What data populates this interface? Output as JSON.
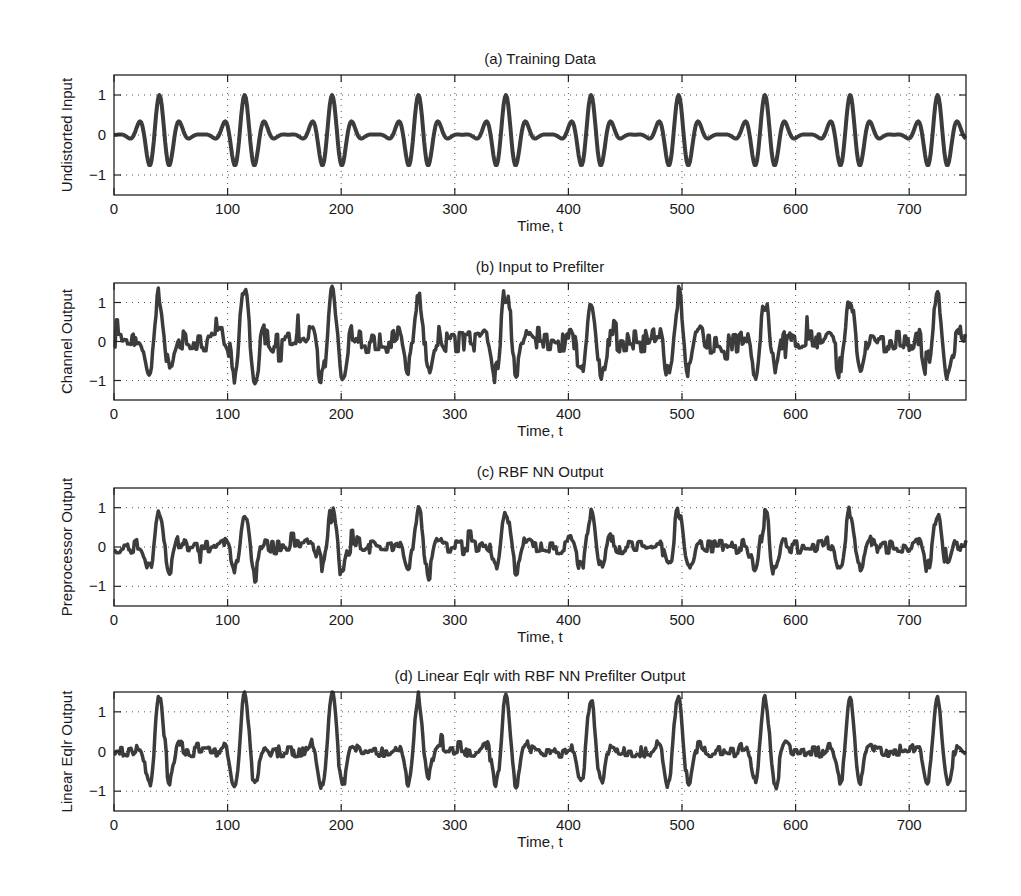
{
  "figure": {
    "background": "#ffffff",
    "line_color": "#3c3c3c",
    "axis_color": "#222222",
    "grid_color": "#555555"
  },
  "chart_data": [
    {
      "id": "a",
      "type": "line",
      "title": "(a) Training Data",
      "xlabel": "Time, t",
      "ylabel": "Undistorted Input",
      "xlim": [
        0,
        750
      ],
      "ylim": [
        -1.5,
        1.5
      ],
      "xticks": [
        0,
        100,
        200,
        300,
        400,
        500,
        600,
        700
      ],
      "yticks": [
        -1,
        0,
        1
      ],
      "ytick_labels": [
        "−1",
        "0",
        "1"
      ],
      "grid": true,
      "signal": {
        "model": "gaussian-windowed cosine pulse train",
        "pulse_centers": [
          40,
          115,
          192,
          268,
          345,
          420,
          497,
          573,
          648,
          725
        ],
        "pulse_amplitude": 1.0,
        "oscillation_period": 18,
        "envelope_sigma": 16.9,
        "noise": 0
      },
      "key_points": [
        {
          "t": 20,
          "y": 0.28
        },
        {
          "t": 31,
          "y": -0.75
        },
        {
          "t": 40,
          "y": 1.0
        },
        {
          "t": 49,
          "y": -0.75
        },
        {
          "t": 58,
          "y": 0.28
        },
        {
          "t": 78,
          "y": 0.0
        }
      ]
    },
    {
      "id": "b",
      "type": "line",
      "title": "(b) Input to Prefilter",
      "xlabel": "Time, t",
      "ylabel": "Channel  Output",
      "xlim": [
        0,
        750
      ],
      "ylim": [
        -1.5,
        1.5
      ],
      "xticks": [
        0,
        100,
        200,
        300,
        400,
        500,
        600,
        700
      ],
      "yticks": [
        -1,
        0,
        1
      ],
      "ytick_labels": [
        "−1",
        "0",
        "1"
      ],
      "grid": true,
      "signal": {
        "model": "distorted pulse train with additive noise",
        "pulse_centers": [
          40,
          115,
          192,
          268,
          345,
          420,
          497,
          573,
          648,
          725
        ],
        "pulse_peaks": [
          1.2,
          1.3,
          1.5,
          1.1,
          1.3,
          1.2,
          1.2,
          1.2,
          1.1,
          1.2
        ],
        "oscillation_period": 20,
        "envelope_sigma": 14,
        "noise": 0.28,
        "seed": 7
      },
      "key_points": [
        {
          "t": 40,
          "y": 1.2
        },
        {
          "t": 192,
          "y": 1.5
        },
        {
          "t": 488,
          "y": -1.2
        },
        {
          "t": 718,
          "y": -1.1
        },
        {
          "t": 262,
          "y": -1.0
        }
      ]
    },
    {
      "id": "c",
      "type": "line",
      "title": "(c) RBF NN Output",
      "xlabel": "Time, t",
      "ylabel": "Preprocessor Output",
      "xlim": [
        0,
        750
      ],
      "ylim": [
        -1.5,
        1.5
      ],
      "xticks": [
        0,
        100,
        200,
        300,
        400,
        500,
        600,
        700
      ],
      "yticks": [
        -1,
        0,
        1
      ],
      "ytick_labels": [
        "−1",
        "0",
        "1"
      ],
      "grid": true,
      "signal": {
        "model": "prefiltered pulse train with reduced noise",
        "pulse_centers": [
          40,
          115,
          192,
          268,
          345,
          420,
          497,
          573,
          648,
          725
        ],
        "pulse_peaks": [
          0.9,
          0.9,
          1.0,
          0.9,
          0.95,
          0.9,
          0.9,
          0.9,
          0.9,
          0.9
        ],
        "oscillation_period": 20,
        "envelope_sigma": 13,
        "noise": 0.17,
        "seed": 11
      },
      "key_points": [
        {
          "t": 40,
          "y": 0.9
        },
        {
          "t": 192,
          "y": 1.0
        },
        {
          "t": 715,
          "y": -0.8
        },
        {
          "t": 338,
          "y": -0.8
        }
      ]
    },
    {
      "id": "d",
      "type": "line",
      "title": "(d) Linear Eqlr with RBF NN Prefilter  Output",
      "xlabel": "Time, t",
      "ylabel": "Linear Eqlr Output",
      "xlim": [
        0,
        750
      ],
      "ylim": [
        -1.5,
        1.5
      ],
      "xticks": [
        0,
        100,
        200,
        300,
        400,
        500,
        600,
        700
      ],
      "yticks": [
        -1,
        0,
        1
      ],
      "ytick_labels": [
        "−1",
        "0",
        "1"
      ],
      "grid": true,
      "signal": {
        "model": "equalized pulse train",
        "pulse_centers": [
          40,
          115,
          192,
          268,
          345,
          420,
          497,
          573,
          648,
          725
        ],
        "pulse_peaks": [
          1.35,
          1.45,
          1.45,
          1.3,
          1.4,
          1.35,
          1.4,
          1.3,
          1.3,
          1.3
        ],
        "oscillation_period": 20,
        "envelope_sigma": 13,
        "noise": 0.13,
        "seed": 23
      },
      "key_points": [
        {
          "t": 40,
          "y": 1.35
        },
        {
          "t": 115,
          "y": 1.45
        },
        {
          "t": 192,
          "y": 1.45
        },
        {
          "t": 126,
          "y": -1.0
        },
        {
          "t": 488,
          "y": -1.1
        },
        {
          "t": 718,
          "y": -1.1
        }
      ]
    }
  ],
  "layout": {
    "axes_left": 114,
    "axes_right": 966,
    "panels": [
      {
        "top": 75,
        "bottom": 195
      },
      {
        "top": 283,
        "bottom": 400
      },
      {
        "top": 488,
        "bottom": 606
      },
      {
        "top": 692,
        "bottom": 811
      }
    ]
  }
}
